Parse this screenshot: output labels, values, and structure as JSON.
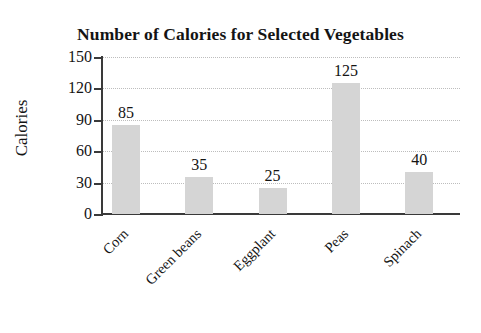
{
  "chart_data": {
    "type": "bar",
    "title": "Number of Calories for Selected Vegetables",
    "xlabel": "",
    "ylabel": "Calories",
    "categories": [
      "Corn",
      "Green beans",
      "Eggplant",
      "Peas",
      "Spinach"
    ],
    "values": [
      85,
      35,
      25,
      125,
      40
    ],
    "value_labels": [
      "85",
      "35",
      "25",
      "125",
      "40"
    ],
    "ylim": [
      0,
      150
    ],
    "yticks": [
      0,
      30,
      60,
      90,
      120,
      150
    ],
    "ytick_labels": [
      "0",
      "30",
      "60",
      "90",
      "120",
      "150"
    ],
    "grid": true,
    "grid_axis": "y",
    "grid_style": "dotted",
    "legend": false,
    "bar_color": "#d5d5d5",
    "axis_color": "#3a3a3a",
    "text_color": "#141414",
    "x_label_rotation": "-45"
  }
}
